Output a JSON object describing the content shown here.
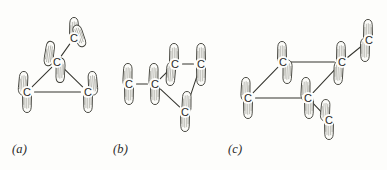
{
  "figure": {
    "type": "chemistry-orbital-diagram",
    "background_color": "#fdfdfb",
    "ink_color": "#35352f",
    "atom_label": "C",
    "panels": [
      {
        "id": "a",
        "label": "(a)",
        "label_x": 12,
        "label_y": 142,
        "description": "cyclopropane ring with bent bonds, three ring carbons plus one upper carbon",
        "atoms": [
          {
            "name": "c-apex",
            "label": "C",
            "x": 57,
            "y": 62
          },
          {
            "name": "c-upper",
            "label": "C",
            "x": 74,
            "y": 38
          },
          {
            "name": "c-bottom-left",
            "label": "C",
            "x": 27,
            "y": 92
          },
          {
            "name": "c-bottom-right",
            "label": "C",
            "x": 88,
            "y": 92
          }
        ],
        "bonds": [
          {
            "from": "c-apex",
            "to": "c-upper"
          },
          {
            "from": "c-apex",
            "to": "c-bottom-left"
          },
          {
            "from": "c-apex",
            "to": "c-bottom-right"
          },
          {
            "from": "c-bottom-left",
            "to": "c-bottom-right"
          }
        ],
        "lobes": [
          {
            "name": "lobe-upper-c-top",
            "x": 74,
            "y": 18,
            "angle": 0,
            "len": 24,
            "w": 9
          },
          {
            "name": "lobe-upper-c-right",
            "x": 83,
            "y": 46,
            "angle": 160,
            "len": 22,
            "w": 9
          },
          {
            "name": "lobe-apex-upleft",
            "x": 51,
            "y": 42,
            "angle": 8,
            "len": 24,
            "w": 9
          },
          {
            "name": "lobe-apex-down",
            "x": 60,
            "y": 82,
            "angle": 182,
            "len": 24,
            "w": 9
          },
          {
            "name": "lobe-bl-up",
            "x": 24,
            "y": 72,
            "angle": 4,
            "len": 23,
            "w": 9
          },
          {
            "name": "lobe-bl-down",
            "x": 27,
            "y": 112,
            "angle": 180,
            "len": 23,
            "w": 9
          },
          {
            "name": "lobe-br-up",
            "x": 92,
            "y": 72,
            "angle": 356,
            "len": 23,
            "w": 9
          },
          {
            "name": "lobe-br-down",
            "x": 88,
            "y": 112,
            "angle": 180,
            "len": 23,
            "w": 9
          }
        ]
      },
      {
        "id": "b",
        "label": "(b)",
        "label_x": 113,
        "label_y": 142,
        "description": "cyclopropane ring with an attached methyl-like chain, four carbons",
        "atoms": [
          {
            "name": "c-left-end",
            "label": "C",
            "x": 129,
            "y": 84
          },
          {
            "name": "c-chain",
            "label": "C",
            "x": 155,
            "y": 84
          },
          {
            "name": "c-ring-top-l",
            "label": "C",
            "x": 175,
            "y": 64
          },
          {
            "name": "c-ring-top-r",
            "label": "C",
            "x": 201,
            "y": 64
          },
          {
            "name": "c-ring-bot",
            "label": "C",
            "x": 185,
            "y": 112
          }
        ],
        "bonds": [
          {
            "from": "c-left-end",
            "to": "c-chain"
          },
          {
            "from": "c-chain",
            "to": "c-ring-top-l"
          },
          {
            "from": "c-chain",
            "to": "c-ring-bot"
          },
          {
            "from": "c-ring-top-l",
            "to": "c-ring-top-r"
          },
          {
            "from": "c-ring-top-r",
            "to": "c-ring-bot"
          }
        ],
        "lobes": [
          {
            "name": "lobe-left-end-up",
            "x": 128,
            "y": 64,
            "angle": 2,
            "len": 23,
            "w": 9
          },
          {
            "name": "lobe-left-end-down",
            "x": 129,
            "y": 104,
            "angle": 180,
            "len": 23,
            "w": 9
          },
          {
            "name": "lobe-chain-up",
            "x": 154,
            "y": 64,
            "angle": 2,
            "len": 23,
            "w": 9
          },
          {
            "name": "lobe-chain-down",
            "x": 155,
            "y": 104,
            "angle": 180,
            "len": 23,
            "w": 9
          },
          {
            "name": "lobe-rtl-up",
            "x": 174,
            "y": 44,
            "angle": 0,
            "len": 23,
            "w": 9
          },
          {
            "name": "lobe-rtl-down",
            "x": 170,
            "y": 85,
            "angle": 184,
            "len": 23,
            "w": 9
          },
          {
            "name": "lobe-rtr-up",
            "x": 201,
            "y": 44,
            "angle": 0,
            "len": 23,
            "w": 9
          },
          {
            "name": "lobe-rtr-down",
            "x": 201,
            "y": 85,
            "angle": 180,
            "len": 23,
            "w": 9
          },
          {
            "name": "lobe-rbot-up",
            "x": 187,
            "y": 92,
            "angle": 2,
            "len": 22,
            "w": 9
          },
          {
            "name": "lobe-rbot-down",
            "x": 185,
            "y": 131,
            "angle": 180,
            "len": 23,
            "w": 9
          }
        ]
      },
      {
        "id": "c",
        "label": "(c)",
        "label_x": 228,
        "label_y": 142,
        "description": "cyclobutane-like four-membered ring drawn in perspective with an extra carbon",
        "atoms": [
          {
            "name": "c-back-left",
            "label": "C",
            "x": 283,
            "y": 62
          },
          {
            "name": "c-back-right",
            "label": "C",
            "x": 342,
            "y": 62
          },
          {
            "name": "c-front-left",
            "label": "C",
            "x": 248,
            "y": 98
          },
          {
            "name": "c-front-right",
            "label": "C",
            "x": 308,
            "y": 98
          },
          {
            "name": "c-upper-right",
            "label": "C",
            "x": 369,
            "y": 40
          },
          {
            "name": "c-lower-right",
            "label": "C",
            "x": 329,
            "y": 120
          }
        ],
        "bonds": [
          {
            "from": "c-back-left",
            "to": "c-back-right"
          },
          {
            "from": "c-back-left",
            "to": "c-front-left"
          },
          {
            "from": "c-front-left",
            "to": "c-front-right"
          },
          {
            "from": "c-back-right",
            "to": "c-front-right"
          },
          {
            "from": "c-back-right",
            "to": "c-upper-right"
          },
          {
            "from": "c-front-right",
            "to": "c-lower-right"
          }
        ],
        "lobes": [
          {
            "name": "lobe-bl-up",
            "x": 282,
            "y": 42,
            "angle": 0,
            "len": 23,
            "w": 9
          },
          {
            "name": "lobe-bl-down",
            "x": 287,
            "y": 83,
            "angle": 182,
            "len": 23,
            "w": 9
          },
          {
            "name": "lobe-br-up",
            "x": 341,
            "y": 42,
            "angle": 0,
            "len": 23,
            "w": 9
          },
          {
            "name": "lobe-br-down",
            "x": 338,
            "y": 84,
            "angle": 182,
            "len": 23,
            "w": 9
          },
          {
            "name": "lobe-fl-up",
            "x": 246,
            "y": 78,
            "angle": 2,
            "len": 23,
            "w": 9
          },
          {
            "name": "lobe-fl-down",
            "x": 248,
            "y": 118,
            "angle": 180,
            "len": 23,
            "w": 9
          },
          {
            "name": "lobe-fr-up",
            "x": 306,
            "y": 78,
            "angle": 2,
            "len": 23,
            "w": 9
          },
          {
            "name": "lobe-fr-down",
            "x": 309,
            "y": 118,
            "angle": 180,
            "len": 23,
            "w": 9
          },
          {
            "name": "lobe-ur-up",
            "x": 368,
            "y": 20,
            "angle": 0,
            "len": 23,
            "w": 9
          },
          {
            "name": "lobe-ur-down",
            "x": 365,
            "y": 61,
            "angle": 180,
            "len": 23,
            "w": 9
          },
          {
            "name": "lobe-lr-up",
            "x": 326,
            "y": 100,
            "angle": 4,
            "len": 21,
            "w": 9
          },
          {
            "name": "lobe-lr-down",
            "x": 329,
            "y": 139,
            "angle": 180,
            "len": 23,
            "w": 9
          }
        ]
      }
    ]
  }
}
